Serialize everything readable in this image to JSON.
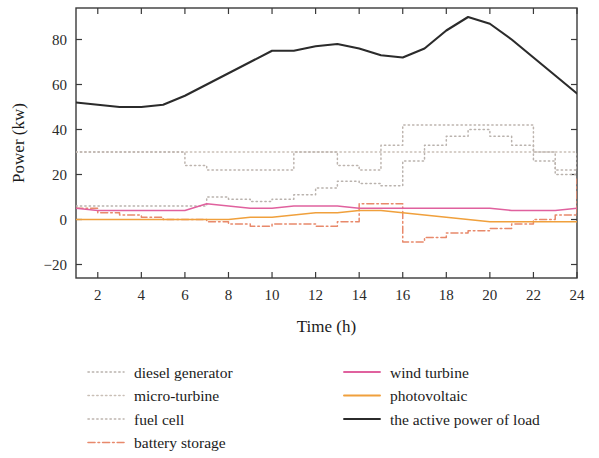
{
  "chart_data": {
    "type": "line",
    "title": "",
    "xlabel": "Time (h)",
    "ylabel": "Power (kw)",
    "xlim": [
      1,
      24
    ],
    "ylim": [
      -26,
      94
    ],
    "xticks": [
      2,
      4,
      6,
      8,
      10,
      12,
      14,
      16,
      18,
      20,
      22,
      24
    ],
    "yticks": [
      -20,
      0,
      20,
      40,
      60,
      80
    ],
    "grid": false,
    "legend_position": "below-plot",
    "x": [
      1,
      2,
      3,
      4,
      5,
      6,
      7,
      8,
      9,
      10,
      11,
      12,
      13,
      14,
      15,
      16,
      17,
      18,
      19,
      20,
      21,
      22,
      23,
      24
    ],
    "series": [
      {
        "name": "diesel generator",
        "color": "#b9b2ad",
        "style": "dotted",
        "values": [
          6,
          6,
          6,
          6,
          6,
          6,
          10,
          9,
          8,
          9,
          11,
          14,
          17,
          16,
          15,
          26,
          33,
          37,
          40,
          37,
          33,
          26,
          20,
          20
        ]
      },
      {
        "name": "micro-turbine",
        "color": "#c9bfb6",
        "style": "dotted",
        "values": [
          30,
          30,
          30,
          30,
          30,
          30,
          30,
          30,
          30,
          30,
          30,
          30,
          30,
          30,
          30,
          30,
          30,
          30,
          30,
          30,
          30,
          30,
          30,
          30
        ]
      },
      {
        "name": "fuel cell",
        "color": "#bdb4ae",
        "style": "dotted",
        "values": [
          30,
          30,
          30,
          30,
          30,
          24,
          22,
          22,
          22,
          22,
          30,
          30,
          24,
          22,
          33,
          42,
          42,
          42,
          42,
          42,
          42,
          30,
          22,
          30
        ]
      },
      {
        "name": "battery storage",
        "color": "#e8896b",
        "style": "dashdot",
        "values": [
          5,
          3,
          2,
          1,
          0,
          0,
          -1,
          -2,
          -3,
          -2,
          -2,
          -3,
          -1,
          7,
          7,
          -10,
          -8,
          -6,
          -5,
          -4,
          -2,
          0,
          2,
          18
        ]
      },
      {
        "name": "wind turbine",
        "color": "#e0619e",
        "style": "solid",
        "values": [
          5,
          4,
          4,
          4,
          4,
          4,
          7,
          6,
          5,
          5,
          6,
          6,
          6,
          5,
          5,
          5,
          5,
          5,
          5,
          5,
          4,
          4,
          4,
          5
        ]
      },
      {
        "name": "photovoltaic",
        "color": "#f0a03c",
        "style": "solid",
        "values": [
          0,
          0,
          0,
          0,
          0,
          0,
          0,
          0,
          1,
          1,
          2,
          3,
          3,
          4,
          4,
          3,
          2,
          1,
          0,
          -1,
          -1,
          -1,
          -1,
          -1
        ]
      },
      {
        "name": "the active power of load",
        "color": "#2b2b2b",
        "style": "solid",
        "values": [
          52,
          51,
          50,
          50,
          51,
          55,
          60,
          65,
          70,
          75,
          75,
          77,
          78,
          76,
          73,
          72,
          76,
          84,
          90,
          87,
          80,
          72,
          64,
          56
        ]
      }
    ]
  },
  "axis": {
    "x_label": "Time (h)",
    "y_label": "Power (kw)",
    "x_ticks": [
      "2",
      "4",
      "6",
      "8",
      "10",
      "12",
      "14",
      "16",
      "18",
      "20",
      "22",
      "24"
    ],
    "y_ticks": [
      "80",
      "60",
      "40",
      "20",
      "0",
      "−20"
    ]
  },
  "legend": {
    "column_left": [
      {
        "label": "diesel generator",
        "color": "#b9b2ad",
        "style": "dotted"
      },
      {
        "label": "micro-turbine",
        "color": "#c9bfb6",
        "style": "dotted"
      },
      {
        "label": "fuel cell",
        "color": "#bdb4ae",
        "style": "dotted"
      },
      {
        "label": "battery storage",
        "color": "#e8896b",
        "style": "dashdot"
      }
    ],
    "column_right": [
      {
        "label": "wind turbine",
        "color": "#e0619e",
        "style": "solid"
      },
      {
        "label": "photovoltaic",
        "color": "#f0a03c",
        "style": "solid"
      },
      {
        "label": "the active power of load",
        "color": "#2b2b2b",
        "style": "solid"
      }
    ]
  }
}
